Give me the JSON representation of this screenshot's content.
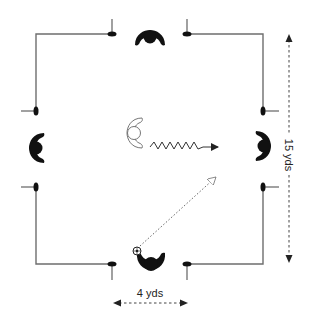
{
  "diagram": {
    "type": "soccer-drill",
    "colors": {
      "line": "#6e6e6e",
      "player": "#111111",
      "background": "#ffffff"
    },
    "field": {
      "width_label": "4 yds",
      "length_label": "15 yds"
    },
    "gates": [
      {
        "side": "top",
        "cones": 2
      },
      {
        "side": "left",
        "cones": 2
      },
      {
        "side": "right",
        "cones": 2
      },
      {
        "side": "bottom",
        "cones": 2
      }
    ],
    "players": [
      {
        "id": "top-defender",
        "role": "gatekeeper",
        "facing": "down"
      },
      {
        "id": "left-defender",
        "role": "gatekeeper",
        "facing": "right"
      },
      {
        "id": "right-defender",
        "role": "gatekeeper",
        "facing": "left"
      },
      {
        "id": "bottom-server",
        "role": "server with ball",
        "facing": "up"
      },
      {
        "id": "center-attacker",
        "role": "attacker (outlined)",
        "facing": "right"
      }
    ],
    "movements": [
      {
        "type": "dribble",
        "style": "zigzag arrow",
        "from": "center-attacker",
        "to": "right gate"
      },
      {
        "type": "pass",
        "style": "dotted arrow",
        "from": "bottom-server",
        "to": "right gate"
      }
    ],
    "labels": {
      "horizontal_dimension": "4 yds",
      "vertical_dimension": "15 yds"
    }
  }
}
